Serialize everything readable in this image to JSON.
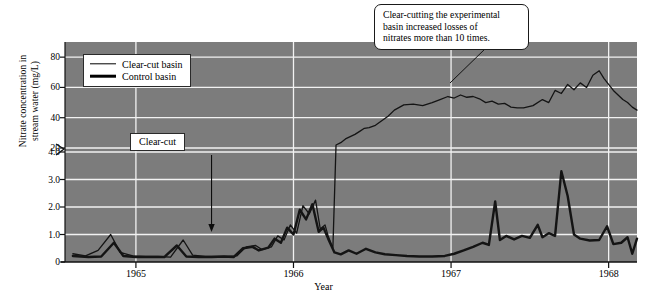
{
  "chart_data": {
    "type": "line",
    "title": "",
    "xlabel": "Year",
    "ylabel": "Nitrate concentration in stream water (mg/L)",
    "ylabel_lines": [
      "Nitrate concentration in",
      "stream water (mg/L)"
    ],
    "grid": true,
    "plot_background": "#7c7c7c",
    "gridline_color": "#f2f2f2",
    "line_color": "#141414",
    "axis_break": true,
    "axis_break_note": "y-axis has a scale break between 4.0 and 20",
    "xlim": [
      1964.55,
      1968.18
    ],
    "xticks": [
      1965,
      1966,
      1967,
      1968
    ],
    "xtick_labels": [
      "1965",
      "1966",
      "1967",
      "1968"
    ],
    "ylim_lower": [
      0,
      4.0
    ],
    "ylim_upper": [
      20,
      90
    ],
    "yticks": [
      0,
      1.0,
      2.0,
      3.0,
      4.0,
      20,
      40,
      60,
      80
    ],
    "ytick_labels": [
      "0",
      "1.0",
      "2.0",
      "3.0",
      "4.0",
      "20",
      "40",
      "60",
      "80"
    ],
    "legend": {
      "position": "upper-left-inside",
      "entries": [
        {
          "label": "Clear-cut basin",
          "style": "thin",
          "linewidth": 1.4
        },
        {
          "label": "Control basin",
          "style": "thick",
          "linewidth": 2.6
        }
      ]
    },
    "annotations": [
      {
        "name": "clear-cut-marker",
        "text": "Clear-cut",
        "lines": [
          "Clear-cut"
        ],
        "arrow": "down",
        "points_to_year": 1965.48
      },
      {
        "name": "main-callout",
        "text": "Clear-cutting the experimental basin increased losses of nitrates more than 10 times.",
        "lines": [
          "Clear-cutting the experimental",
          "basin increased losses of",
          "nitrates more than 10 times."
        ],
        "leader_line": true
      }
    ],
    "series": [
      {
        "name": "Clear-cut basin",
        "style": "thin",
        "note": "experimental basin; near zero until clear-cut, then jumps above 20 mg/L",
        "points": [
          [
            1964.6,
            0.3
          ],
          [
            1964.68,
            0.22
          ],
          [
            1964.76,
            0.42
          ],
          [
            1964.84,
            1.0
          ],
          [
            1964.9,
            0.35
          ],
          [
            1964.98,
            0.22
          ],
          [
            1965.06,
            0.2
          ],
          [
            1965.14,
            0.2
          ],
          [
            1965.22,
            0.18
          ],
          [
            1965.3,
            0.8
          ],
          [
            1965.36,
            0.25
          ],
          [
            1965.44,
            0.2
          ],
          [
            1965.52,
            0.2
          ],
          [
            1965.58,
            0.2
          ],
          [
            1965.64,
            0.22
          ],
          [
            1965.7,
            0.55
          ],
          [
            1965.76,
            0.6
          ],
          [
            1965.8,
            0.45
          ],
          [
            1965.86,
            0.55
          ],
          [
            1965.9,
            0.95
          ],
          [
            1965.94,
            0.8
          ],
          [
            1965.98,
            1.35
          ],
          [
            1966.02,
            1.05
          ],
          [
            1966.06,
            2.05
          ],
          [
            1966.1,
            1.75
          ],
          [
            1966.14,
            2.25
          ],
          [
            1966.17,
            1.2
          ],
          [
            1966.2,
            1.35
          ],
          [
            1966.22,
            0.95
          ],
          [
            1966.25,
            0.5
          ],
          [
            1966.27,
            22.0
          ],
          [
            1966.3,
            23.5
          ],
          [
            1966.33,
            26.0
          ],
          [
            1966.36,
            27.5
          ],
          [
            1966.39,
            29.0
          ],
          [
            1966.42,
            31.0
          ],
          [
            1966.45,
            33.0
          ],
          [
            1966.48,
            33.5
          ],
          [
            1966.52,
            35.0
          ],
          [
            1966.56,
            38.0
          ],
          [
            1966.6,
            41.0
          ],
          [
            1966.64,
            45.0
          ],
          [
            1966.7,
            48.5
          ],
          [
            1966.76,
            49.0
          ],
          [
            1966.82,
            48.0
          ],
          [
            1966.88,
            50.0
          ],
          [
            1966.93,
            52.0
          ],
          [
            1966.98,
            54.0
          ],
          [
            1967.02,
            53.0
          ],
          [
            1967.06,
            55.0
          ],
          [
            1967.1,
            53.5
          ],
          [
            1967.14,
            54.0
          ],
          [
            1967.18,
            52.5
          ],
          [
            1967.22,
            50.0
          ],
          [
            1967.26,
            51.0
          ],
          [
            1967.3,
            49.0
          ],
          [
            1967.34,
            49.5
          ],
          [
            1967.38,
            47.0
          ],
          [
            1967.42,
            46.5
          ],
          [
            1967.46,
            46.5
          ],
          [
            1967.52,
            48.0
          ],
          [
            1967.58,
            52.0
          ],
          [
            1967.62,
            50.0
          ],
          [
            1967.66,
            58.0
          ],
          [
            1967.7,
            56.0
          ],
          [
            1967.74,
            62.0
          ],
          [
            1967.78,
            58.5
          ],
          [
            1967.82,
            63.0
          ],
          [
            1967.86,
            60.0
          ],
          [
            1967.9,
            68.0
          ],
          [
            1967.94,
            71.0
          ],
          [
            1967.97,
            66.0
          ],
          [
            1968.0,
            62.0
          ],
          [
            1968.03,
            58.0
          ],
          [
            1968.06,
            55.0
          ],
          [
            1968.09,
            52.0
          ],
          [
            1968.12,
            50.0
          ],
          [
            1968.15,
            47.0
          ],
          [
            1968.18,
            45.0
          ]
        ]
      },
      {
        "name": "Control basin",
        "style": "thick",
        "note": "reference basin; stays below about 3.3 mg/L throughout",
        "points": [
          [
            1964.6,
            0.22
          ],
          [
            1964.7,
            0.18
          ],
          [
            1964.78,
            0.2
          ],
          [
            1964.86,
            0.7
          ],
          [
            1964.92,
            0.22
          ],
          [
            1965.0,
            0.18
          ],
          [
            1965.1,
            0.18
          ],
          [
            1965.18,
            0.18
          ],
          [
            1965.26,
            0.6
          ],
          [
            1965.32,
            0.2
          ],
          [
            1965.4,
            0.18
          ],
          [
            1965.48,
            0.18
          ],
          [
            1965.56,
            0.2
          ],
          [
            1965.62,
            0.18
          ],
          [
            1965.68,
            0.5
          ],
          [
            1965.74,
            0.55
          ],
          [
            1965.78,
            0.42
          ],
          [
            1965.84,
            0.52
          ],
          [
            1965.88,
            0.85
          ],
          [
            1965.92,
            0.7
          ],
          [
            1965.96,
            1.25
          ],
          [
            1966.0,
            1.0
          ],
          [
            1966.04,
            1.9
          ],
          [
            1966.08,
            1.55
          ],
          [
            1966.12,
            2.1
          ],
          [
            1966.16,
            1.1
          ],
          [
            1966.19,
            1.25
          ],
          [
            1966.22,
            0.85
          ],
          [
            1966.26,
            0.35
          ],
          [
            1966.3,
            0.28
          ],
          [
            1966.35,
            0.42
          ],
          [
            1966.4,
            0.3
          ],
          [
            1966.46,
            0.48
          ],
          [
            1966.52,
            0.35
          ],
          [
            1966.58,
            0.28
          ],
          [
            1966.65,
            0.25
          ],
          [
            1966.72,
            0.22
          ],
          [
            1966.8,
            0.2
          ],
          [
            1966.88,
            0.2
          ],
          [
            1966.96,
            0.22
          ],
          [
            1967.02,
            0.3
          ],
          [
            1967.08,
            0.42
          ],
          [
            1967.14,
            0.55
          ],
          [
            1967.2,
            0.7
          ],
          [
            1967.24,
            0.62
          ],
          [
            1967.28,
            2.2
          ],
          [
            1967.31,
            0.8
          ],
          [
            1967.35,
            0.95
          ],
          [
            1967.4,
            0.82
          ],
          [
            1967.45,
            0.95
          ],
          [
            1967.5,
            0.88
          ],
          [
            1967.55,
            1.35
          ],
          [
            1967.58,
            0.9
          ],
          [
            1967.62,
            1.05
          ],
          [
            1967.66,
            0.95
          ],
          [
            1967.7,
            3.3
          ],
          [
            1967.74,
            2.4
          ],
          [
            1967.78,
            1.0
          ],
          [
            1967.82,
            0.85
          ],
          [
            1967.88,
            0.78
          ],
          [
            1967.94,
            0.8
          ],
          [
            1967.99,
            1.3
          ],
          [
            1968.03,
            0.65
          ],
          [
            1968.08,
            0.7
          ],
          [
            1968.12,
            0.9
          ],
          [
            1968.15,
            0.3
          ],
          [
            1968.18,
            0.85
          ]
        ]
      }
    ]
  }
}
